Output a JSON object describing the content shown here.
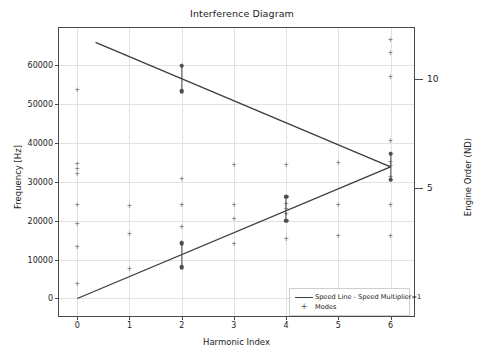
{
  "chart_data": {
    "type": "scatter",
    "title": "Interference Diagram",
    "xlabel": "Harmonic Index",
    "ylabel": "Frequency [Hz]",
    "y2label": "Engine Order (ND)",
    "xlim": [
      -0.35,
      6.45
    ],
    "ylim": [
      -4500,
      69500
    ],
    "y2lim": [
      -0.8,
      12.3
    ],
    "xticks": [
      0,
      1,
      2,
      3,
      4,
      5,
      6
    ],
    "xticklabels": [
      "0",
      "1",
      "2",
      "3",
      "4",
      "5",
      "6"
    ],
    "yticks": [
      0,
      10000,
      20000,
      30000,
      40000,
      50000,
      60000
    ],
    "yticklabels": [
      "0",
      "10000",
      "20000",
      "30000",
      "40000",
      "50000",
      "60000"
    ],
    "y2ticks": [
      5,
      10
    ],
    "y2ticklabels": [
      "5",
      "10"
    ],
    "grid": true,
    "legend_position": "lower right",
    "series": [
      {
        "name": "Speed Line - Speed Multiplier=1",
        "type": "line",
        "color": "#3c3c3c",
        "points": [
          {
            "x": 0.0,
            "y": 0
          },
          {
            "x": 6.0,
            "y": 33800
          }
        ]
      },
      {
        "name": "Speed Line - Reflected",
        "type": "line",
        "color": "#3c3c3c",
        "points": [
          {
            "x": 0.35,
            "y": 65800
          },
          {
            "x": 6.0,
            "y": 33800
          }
        ]
      },
      {
        "name": "Modes",
        "type": "scatter",
        "marker": "+",
        "color": "#575757",
        "points": [
          {
            "x": 0,
            "y": 53500
          },
          {
            "x": 0,
            "y": 34500
          },
          {
            "x": 0,
            "y": 33200
          },
          {
            "x": 0,
            "y": 32000
          },
          {
            "x": 0,
            "y": 24000
          },
          {
            "x": 0,
            "y": 19100
          },
          {
            "x": 0,
            "y": 13200
          },
          {
            "x": 0,
            "y": 3600
          },
          {
            "x": 1,
            "y": 23800
          },
          {
            "x": 1,
            "y": 16500
          },
          {
            "x": 1,
            "y": 7500
          },
          {
            "x": 2,
            "y": 59800
          },
          {
            "x": 2,
            "y": 53200
          },
          {
            "x": 2,
            "y": 30800
          },
          {
            "x": 2,
            "y": 24000
          },
          {
            "x": 2,
            "y": 18400
          },
          {
            "x": 2,
            "y": 14200
          },
          {
            "x": 2,
            "y": 8000
          },
          {
            "x": 3,
            "y": 34200
          },
          {
            "x": 3,
            "y": 24000
          },
          {
            "x": 3,
            "y": 20400
          },
          {
            "x": 3,
            "y": 14000
          },
          {
            "x": 4,
            "y": 34200
          },
          {
            "x": 4,
            "y": 26200
          },
          {
            "x": 4,
            "y": 24300
          },
          {
            "x": 4,
            "y": 23000
          },
          {
            "x": 4,
            "y": 21800
          },
          {
            "x": 4,
            "y": 20000
          },
          {
            "x": 4,
            "y": 15400
          },
          {
            "x": 5,
            "y": 34800
          },
          {
            "x": 5,
            "y": 24000
          },
          {
            "x": 5,
            "y": 16000
          },
          {
            "x": 6,
            "y": 66500
          },
          {
            "x": 6,
            "y": 63200
          },
          {
            "x": 6,
            "y": 57000
          },
          {
            "x": 6,
            "y": 40500
          },
          {
            "x": 6,
            "y": 37200
          },
          {
            "x": 6,
            "y": 35000
          },
          {
            "x": 6,
            "y": 34000
          },
          {
            "x": 6,
            "y": 31200
          },
          {
            "x": 6,
            "y": 30500
          },
          {
            "x": 6,
            "y": 24000
          },
          {
            "x": 6,
            "y": 16000
          }
        ]
      }
    ],
    "highlighted_modes": [
      {
        "x": 2,
        "y_top": 59800,
        "y_bottom": 53200
      },
      {
        "x": 2,
        "y_top": 14200,
        "y_bottom": 8000
      },
      {
        "x": 4,
        "y_top": 26200,
        "y_bottom": 20000
      },
      {
        "x": 6,
        "y_top": 37200,
        "y_bottom": 30500
      }
    ]
  },
  "legend": {
    "items": [
      {
        "label": "Speed Line - Speed Multiplier=1",
        "symbol": "line"
      },
      {
        "label": "Modes",
        "symbol": "plus"
      }
    ]
  }
}
